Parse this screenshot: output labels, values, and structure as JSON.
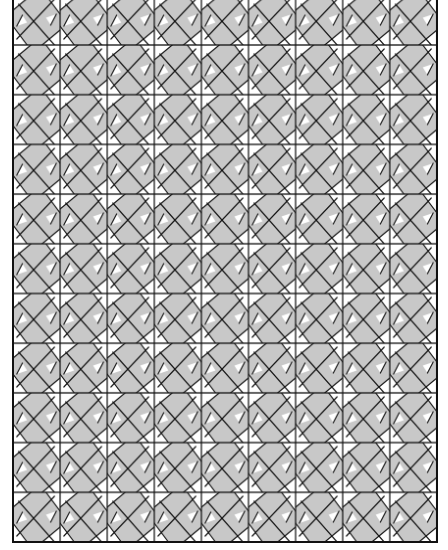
{
  "image": {
    "description": "Gray and white geometric tessellation with black lines forming a repeating pinwheel/basketweave motif",
    "colors": {
      "background": "#ffffff",
      "tile_fill": "#c8c8c8",
      "triangle_fill": "#ffffff",
      "line": "#111111"
    },
    "grid": {
      "left": 13,
      "right": 437,
      "top": -5,
      "bottom": 542,
      "columns": 9,
      "rows": 11,
      "cell_width": 47.1,
      "cell_height": 49.7,
      "first_horizontal_line": 45
    }
  }
}
